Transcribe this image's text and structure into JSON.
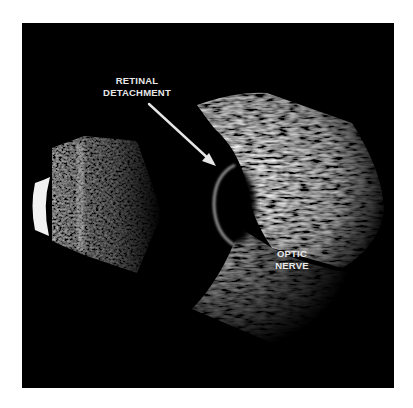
{
  "figure": {
    "type": "ocular-b-scan-ultrasound",
    "annotations": [
      {
        "id": "retinal-detachment",
        "lines": [
          "RETINAL",
          "DETACHMENT"
        ],
        "pointer": "arrow"
      },
      {
        "id": "optic-nerve",
        "lines": [
          "OPTIC",
          "NERVE"
        ],
        "pointer": "none"
      }
    ],
    "colors": {
      "background": "#000000",
      "page": "#ffffff",
      "label": "#e8e8e8",
      "arrow": "#e6e6e6",
      "tissue": "#bdbdbd"
    }
  }
}
